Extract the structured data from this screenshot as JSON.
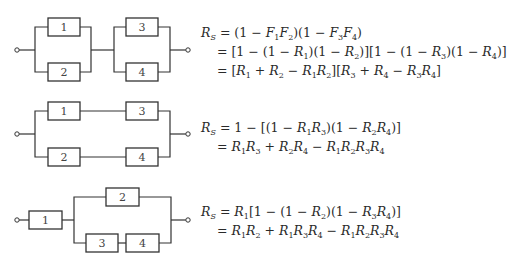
{
  "diagrams": [
    {
      "name": "parallel-series",
      "blocks": [
        "1",
        "2",
        "3",
        "4"
      ],
      "equation": {
        "lhs": "R_S",
        "lines": [
          "R_S = (1 − F_1 F_2)(1 − F_3 F_4)",
          "= [1 − (1 − R_1)(1 − R_2)][1 − (1 − R_3)(1 − R_4)]",
          "= [R_1 + R_2 − R_1 R_2][R_3 + R_4 − R_3 R_4]"
        ]
      }
    },
    {
      "name": "series-parallel",
      "blocks": [
        "1",
        "3",
        "2",
        "4"
      ],
      "equation": {
        "lhs": "R_S",
        "lines": [
          "R_S = 1 − [(1 − R_1 R_3)(1 − R_2 R_4)]",
          "= R_1 R_3 + R_2 R_4 − R_1 R_2 R_3 R_4"
        ]
      }
    },
    {
      "name": "mixed",
      "blocks": [
        "1",
        "2",
        "3",
        "4"
      ],
      "equation": {
        "lhs": "R_S",
        "lines": [
          "R_S = R_1[1 − (1 − R_2)(1 − R_3 R_4)]",
          "= R_1 R_2 + R_1 R_3 R_4 − R_1 R_2 R_3 R_4"
        ]
      }
    }
  ],
  "labels": {
    "d1": {
      "b1": "1",
      "b2": "2",
      "b3": "3",
      "b4": "4"
    },
    "d2": {
      "b1": "1",
      "b2": "2",
      "b3": "3",
      "b4": "4"
    },
    "d3": {
      "b1": "1",
      "b2": "2",
      "b3": "3",
      "b4": "4"
    }
  },
  "symbols": {
    "R": "R",
    "F": "F",
    "S": "S",
    "eq": "=",
    "minus": "−",
    "plus": "+",
    "one": "1",
    "i1": "1",
    "i2": "2",
    "i3": "3",
    "i4": "4",
    "lp": "(",
    "rp": ")",
    "lb": "[",
    "rb": "]"
  }
}
